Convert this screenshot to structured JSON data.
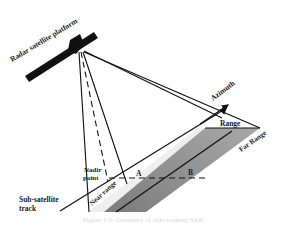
{
  "diagram": {
    "labels": {
      "platform": "Radar satellite platform",
      "azimuth": "Azimuth",
      "range": "Range",
      "far_range": "Far Range",
      "near_range": "Near range",
      "nadir_line1": "Nadir",
      "nadir_line2": "point",
      "point_a": "A",
      "point_b": "B",
      "track_line1": "Sub-satellite",
      "track_line2": "track"
    },
    "caption": "Figure 1.3: Geometry of side-looking SAR",
    "colors": {
      "line": "#111111",
      "swath": "#8a8a8a",
      "swath_light": "#f2f2f2",
      "satellite": "#111111"
    }
  }
}
